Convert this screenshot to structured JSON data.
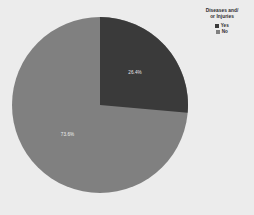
{
  "background_color": "#ececec",
  "legend": {
    "title_line1": "Diseases and/",
    "title_line2": "or Injuries",
    "position": "top-right",
    "items": [
      {
        "label": "Yes",
        "color": "#3a3a3a"
      },
      {
        "label": "No",
        "color": "#808080"
      }
    ]
  },
  "chart_data": {
    "type": "pie",
    "xlabel": "",
    "ylabel": "",
    "grid": false,
    "legend_position": "top-right",
    "start_angle_deg": 0,
    "direction": "clockwise",
    "categories": [
      "Yes",
      "No"
    ],
    "values": [
      26.4,
      73.6
    ],
    "colors": [
      "#3a3a3a",
      "#808080"
    ],
    "labels": [
      "26.4%",
      "73.6%"
    ],
    "label_colors": [
      "#e8e8e8",
      "#f0f0f0"
    ],
    "slices": [
      {
        "name": "Yes",
        "value": 26.4,
        "label": "26.4%",
        "color": "#3a3a3a",
        "label_color": "#e8e8e8"
      },
      {
        "name": "No",
        "value": 73.6,
        "label": "73.6%",
        "color": "#808080",
        "label_color": "#f0f0f0"
      }
    ]
  }
}
